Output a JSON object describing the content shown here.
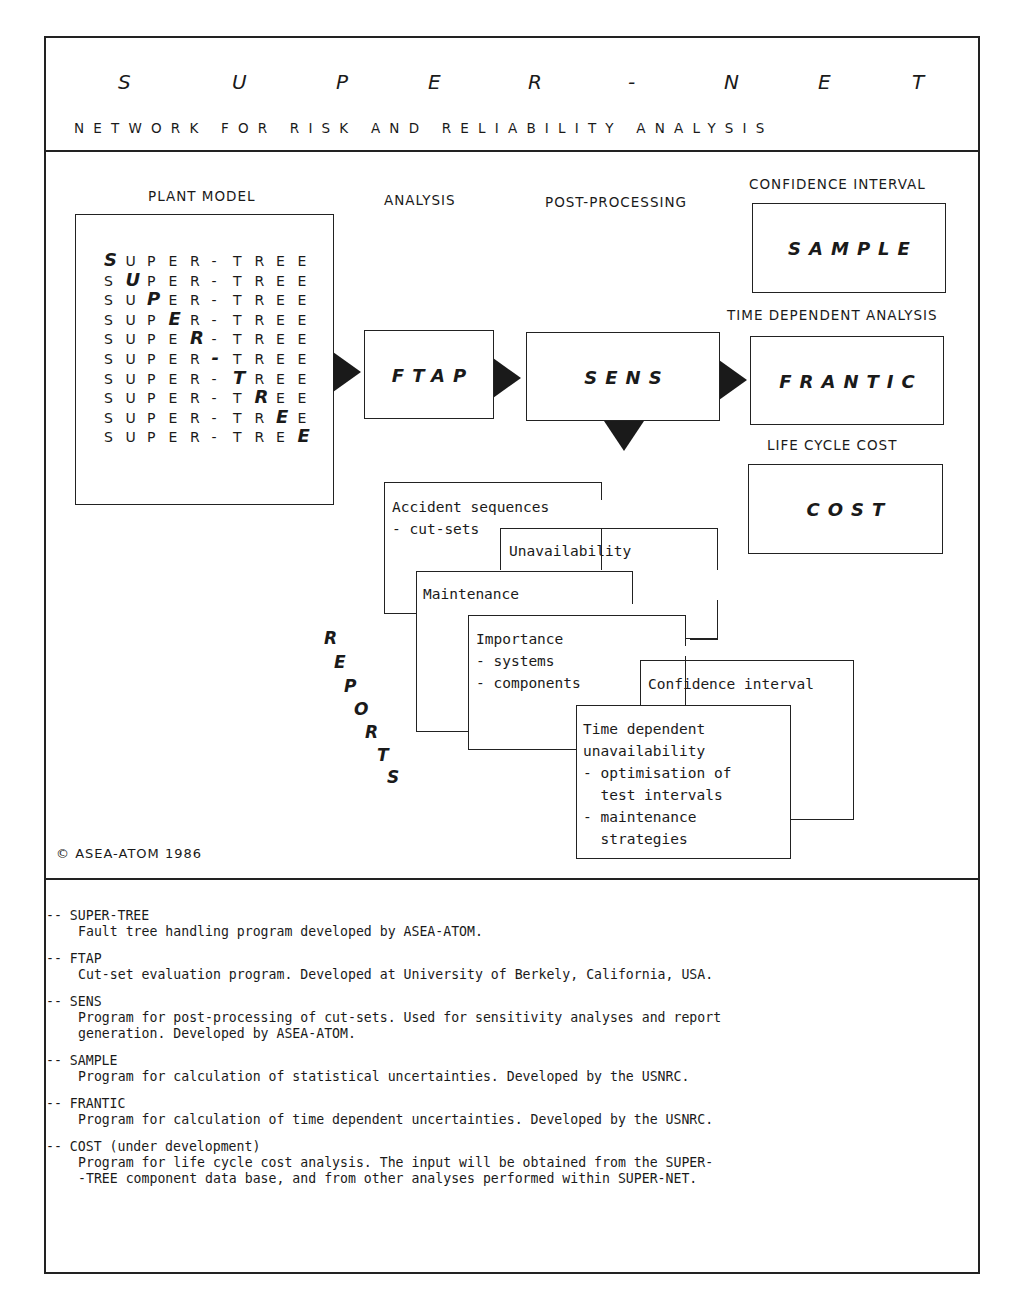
{
  "header": {
    "title_letters": [
      "S",
      "U",
      "P",
      "E",
      "R",
      "-",
      "N",
      "E",
      "T"
    ],
    "title": "SUPER-NET",
    "subtitle": "NETWORK FOR RISK AND RELIABILITY ANALYSIS"
  },
  "diagram": {
    "column_labels": {
      "plant_model": "PLANT MODEL",
      "analysis": "ANALYSIS",
      "post_processing": "POST-PROCESSING",
      "confidence_interval": "CONFIDENCE INTERVAL",
      "time_dependent": "TIME DEPENDENT ANALYSIS",
      "life_cycle_cost": "LIFE CYCLE COST"
    },
    "plant_model": {
      "word": [
        "S",
        "U",
        "P",
        "E",
        "R",
        "-",
        "T",
        "R",
        "E",
        "E"
      ],
      "rows": 10
    },
    "boxes": {
      "ftap": "FTAP",
      "sens": "SENS",
      "sample": "SAMPLE",
      "frantic": "FRANTIC",
      "cost": "COST"
    },
    "reports_label_letters": [
      "R",
      "E",
      "P",
      "O",
      "R",
      "T",
      "S"
    ],
    "reports": [
      {
        "id": "accident",
        "lines": [
          "Accident sequences",
          "- cut-sets"
        ]
      },
      {
        "id": "unavailability",
        "lines": [
          "Unavailability"
        ]
      },
      {
        "id": "maintenance",
        "lines": [
          "Maintenance"
        ]
      },
      {
        "id": "importance",
        "lines": [
          "Importance",
          "- systems",
          "- components"
        ]
      },
      {
        "id": "confidence",
        "lines": [
          "Confidence interval"
        ]
      },
      {
        "id": "time_dependent",
        "lines": [
          "Time dependent",
          "unavailability",
          "- optimisation of",
          "  test intervals",
          "- maintenance",
          "  strategies"
        ]
      }
    ],
    "copyright": "© ASEA-ATOM 1986"
  },
  "legend": [
    {
      "term": "-- SUPER-TREE",
      "desc": [
        "Fault tree handling program developed by ASEA-ATOM."
      ]
    },
    {
      "term": "-- FTAP",
      "desc": [
        "Cut-set evaluation program. Developed at University of Berkely, California, USA."
      ]
    },
    {
      "term": "-- SENS",
      "desc": [
        "Program for post-processing of cut-sets. Used for sensitivity analyses and report",
        "generation. Developed by ASEA-ATOM."
      ]
    },
    {
      "term": "-- SAMPLE",
      "desc": [
        "Program for calculation of statistical uncertainties. Developed by the USNRC."
      ]
    },
    {
      "term": "-- FRANTIC",
      "desc": [
        "Program for calculation of time dependent uncertainties. Developed by the USNRC."
      ]
    },
    {
      "term": "-- COST (under development)",
      "desc": [
        "Program for life cycle cost analysis. The input will be obtained from the SUPER-",
        "-TREE component data base, and from other analyses performed within SUPER-NET."
      ]
    }
  ]
}
